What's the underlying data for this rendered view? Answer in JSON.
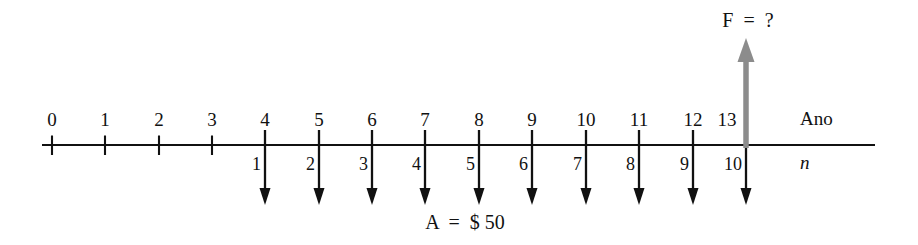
{
  "diagram": {
    "kind": "cash-flow-timeline",
    "background_color": "#ffffff",
    "axis": {
      "color": "#111111",
      "y": 145,
      "x_start": 42,
      "x_end": 875,
      "above_caption": "Ano",
      "below_caption": "n",
      "above_caption_x": 800,
      "above_caption_y": 109,
      "below_caption_x": 800,
      "below_caption_y": 153
    },
    "year_ticks": [
      {
        "label": "0",
        "x": 52,
        "plain_tick": true
      },
      {
        "label": "1",
        "x": 105,
        "plain_tick": true
      },
      {
        "label": "2",
        "x": 159,
        "plain_tick": true
      },
      {
        "label": "3",
        "x": 212,
        "plain_tick": true
      },
      {
        "label": "4",
        "x": 265,
        "plain_tick": false
      },
      {
        "label": "5",
        "x": 319,
        "plain_tick": false
      },
      {
        "label": "6",
        "x": 372,
        "plain_tick": false
      },
      {
        "label": "7",
        "x": 425,
        "plain_tick": false
      },
      {
        "label": "8",
        "x": 479,
        "plain_tick": false
      },
      {
        "label": "9",
        "x": 532,
        "plain_tick": false
      },
      {
        "label": "10",
        "x": 586,
        "plain_tick": false
      },
      {
        "label": "11",
        "x": 639,
        "plain_tick": false
      },
      {
        "label": "12",
        "x": 693,
        "plain_tick": false
      },
      {
        "label": "13",
        "x": 746,
        "plain_tick": false,
        "label_x": 727
      }
    ],
    "payment_arrows": {
      "color": "#111111",
      "direction": "down",
      "top_y": 130,
      "tip_y": 205,
      "items": [
        {
          "period": "1",
          "x": 265
        },
        {
          "period": "2",
          "x": 319
        },
        {
          "period": "3",
          "x": 372
        },
        {
          "period": "4",
          "x": 425
        },
        {
          "period": "5",
          "x": 479
        },
        {
          "period": "6",
          "x": 532
        },
        {
          "period": "7",
          "x": 586
        },
        {
          "period": "8",
          "x": 639
        },
        {
          "period": "9",
          "x": 693
        },
        {
          "period": "10",
          "x": 746
        }
      ]
    },
    "future_arrow": {
      "color": "#8c8c8c",
      "direction": "up",
      "x": 746,
      "base_y": 148,
      "tip_y": 38,
      "label": "F  =  ?",
      "label_x": 748,
      "label_y": 10
    },
    "cash_flow_label": {
      "text": "A  =  $ 50",
      "x": 465,
      "y": 212
    }
  }
}
